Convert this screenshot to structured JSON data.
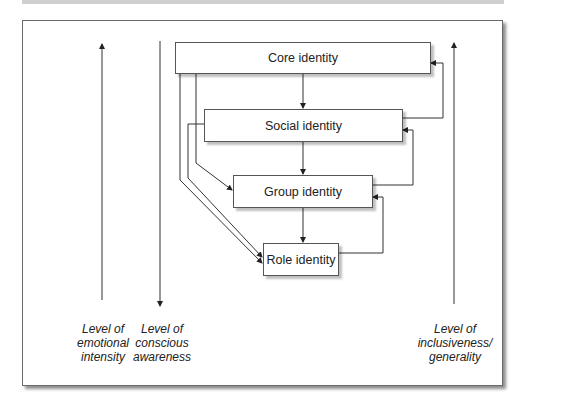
{
  "diagram": {
    "boxes": {
      "core": "Core identity",
      "social": "Social identity",
      "group": "Group identity",
      "role": "Role identity"
    },
    "axes": {
      "emotional": {
        "lines": [
          "Level of",
          "emotional",
          "intensity"
        ],
        "direction": "up"
      },
      "conscious": {
        "lines": [
          "Level of",
          "conscious",
          "awareness"
        ],
        "direction": "down"
      },
      "inclusiveness": {
        "lines": [
          "Level of",
          "inclusiveness/",
          "generality"
        ],
        "direction": "up"
      }
    },
    "colors": {
      "line": "#333333",
      "frame": "#6a6a6a",
      "text": "#222222"
    }
  }
}
